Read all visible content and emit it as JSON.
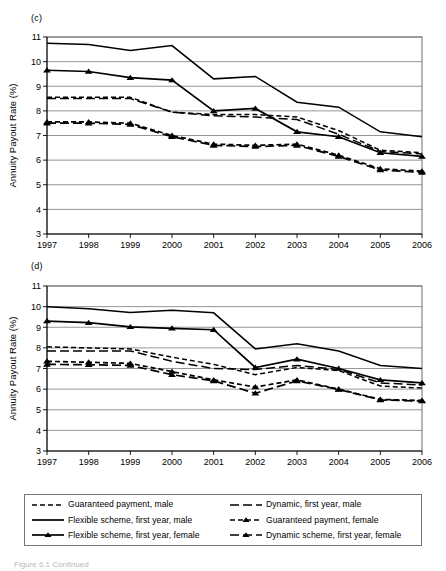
{
  "figure": {
    "panel_c_label": "(c)",
    "panel_d_label": "(d)",
    "caption": "Figure 6.1  Continued"
  },
  "legend": {
    "items": [
      {
        "label": "Guaranteed payment, male",
        "style": "dashed",
        "marker": "none",
        "icon": "dashed-line-swatch"
      },
      {
        "label": "Dynamic, first year, male",
        "style": "long-dash",
        "marker": "none",
        "icon": "long-dash-line-swatch"
      },
      {
        "label": "Flexible scheme, first year, male",
        "style": "solid",
        "marker": "none",
        "icon": "solid-line-swatch"
      },
      {
        "label": "Guaranteed payment, female",
        "style": "dashed",
        "marker": "triangle",
        "icon": "dashed-triangle-swatch"
      },
      {
        "label": "Flexible scheme, first year, female",
        "style": "solid",
        "marker": "triangle",
        "icon": "solid-triangle-swatch"
      },
      {
        "label": "Dynamic scheme, first year, female",
        "style": "long-dash",
        "marker": "triangle",
        "icon": "long-dash-triangle-swatch"
      }
    ]
  },
  "chart_data": [
    {
      "id": "c",
      "type": "line",
      "title": "(c)",
      "xlabel": "",
      "ylabel": "Annuity Payout Rate (%)",
      "categories": [
        "1997",
        "1998",
        "1999",
        "2000",
        "2001",
        "2002",
        "2003",
        "2004",
        "2005",
        "2006"
      ],
      "ylim": [
        3,
        11
      ],
      "yticks": [
        3,
        4,
        5,
        6,
        7,
        8,
        9,
        10,
        11
      ],
      "grid": true,
      "legend_position": "below-figure",
      "series": [
        {
          "name": "Flexible scheme, first year, male",
          "style": "solid",
          "marker": "none",
          "values": [
            10.75,
            10.7,
            10.45,
            10.65,
            9.3,
            9.4,
            8.35,
            8.15,
            7.15,
            6.95
          ]
        },
        {
          "name": "Flexible scheme, first year, female",
          "style": "solid",
          "marker": "triangle",
          "values": [
            9.65,
            9.6,
            9.35,
            9.25,
            8.0,
            8.1,
            7.15,
            6.95,
            6.3,
            6.15
          ]
        },
        {
          "name": "Guaranteed payment, male",
          "style": "dashed",
          "marker": "none",
          "values": [
            8.55,
            8.55,
            8.55,
            7.95,
            7.85,
            7.85,
            7.75,
            7.2,
            6.4,
            6.3
          ]
        },
        {
          "name": "Dynamic, first year, male",
          "style": "long-dash",
          "marker": "none",
          "values": [
            8.5,
            8.5,
            8.5,
            7.95,
            7.8,
            7.75,
            7.65,
            7.05,
            6.35,
            6.25
          ]
        },
        {
          "name": "Guaranteed payment, female",
          "style": "dashed",
          "marker": "triangle",
          "values": [
            7.55,
            7.55,
            7.5,
            7.0,
            6.65,
            6.6,
            6.65,
            6.2,
            5.65,
            5.55
          ]
        },
        {
          "name": "Dynamic scheme, first year, female",
          "style": "long-dash",
          "marker": "triangle",
          "values": [
            7.5,
            7.5,
            7.45,
            6.95,
            6.6,
            6.55,
            6.6,
            6.15,
            5.6,
            5.5
          ]
        }
      ]
    },
    {
      "id": "d",
      "type": "line",
      "title": "(d)",
      "xlabel": "",
      "ylabel": "Annuity Payout Rate (%)",
      "categories": [
        "1997",
        "1998",
        "1999",
        "2000",
        "2001",
        "2002",
        "2003",
        "2004",
        "2005",
        "2006"
      ],
      "ylim": [
        3,
        11
      ],
      "yticks": [
        3,
        4,
        5,
        6,
        7,
        8,
        9,
        10,
        11
      ],
      "grid": true,
      "legend_position": "below-figure",
      "series": [
        {
          "name": "Flexible scheme, first year, male",
          "style": "solid",
          "marker": "none",
          "values": [
            10.0,
            9.9,
            9.72,
            9.82,
            9.7,
            7.95,
            8.2,
            7.85,
            7.15,
            7.0
          ]
        },
        {
          "name": "Flexible scheme, first year, female",
          "style": "solid",
          "marker": "triangle",
          "values": [
            9.3,
            9.22,
            9.02,
            8.95,
            8.88,
            7.05,
            7.45,
            7.0,
            6.45,
            6.3
          ]
        },
        {
          "name": "Guaranteed payment, male",
          "style": "dashed",
          "marker": "none",
          "values": [
            8.05,
            8.0,
            7.95,
            7.55,
            7.2,
            6.7,
            7.05,
            6.9,
            6.15,
            6.05
          ]
        },
        {
          "name": "Dynamic, first year, male",
          "style": "long-dash",
          "marker": "none",
          "values": [
            7.85,
            7.85,
            7.85,
            7.35,
            7.0,
            6.95,
            7.15,
            6.95,
            6.3,
            6.2
          ]
        },
        {
          "name": "Guaranteed payment, female",
          "style": "dashed",
          "marker": "triangle",
          "values": [
            7.35,
            7.3,
            7.25,
            6.85,
            6.45,
            6.1,
            6.45,
            6.0,
            5.5,
            5.45
          ]
        },
        {
          "name": "Dynamic scheme, first year, female",
          "style": "long-dash",
          "marker": "triangle",
          "values": [
            7.2,
            7.18,
            7.15,
            6.7,
            6.4,
            5.8,
            6.4,
            5.98,
            5.48,
            5.42
          ]
        }
      ]
    }
  ]
}
